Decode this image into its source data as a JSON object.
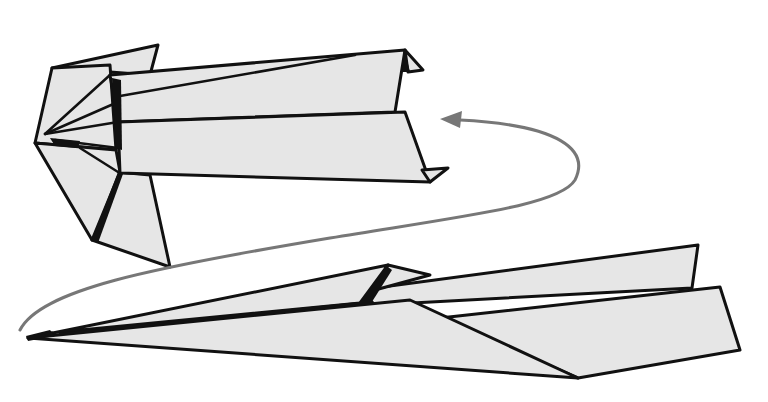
{
  "diagram": {
    "title": "Paper airplane flight illustration",
    "colors": {
      "background": "#ffffff",
      "paper_fill": "#e6e6e6",
      "outline": "#111111",
      "arrow": "#777777"
    },
    "elements": [
      {
        "id": "plane-rear-view",
        "label": "Paper airplane (rear/top view)"
      },
      {
        "id": "plane-side-view",
        "label": "Paper airplane (side view, in flight)"
      },
      {
        "id": "motion-arrow",
        "label": "Curved flight-path arrow"
      }
    ]
  }
}
